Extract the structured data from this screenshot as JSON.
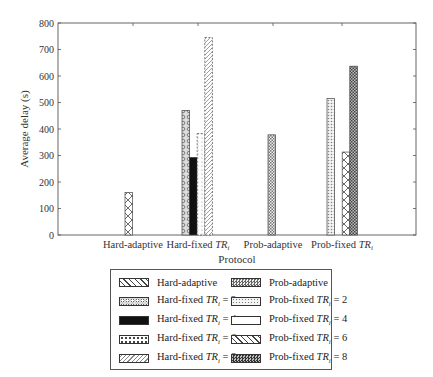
{
  "chart_data": {
    "type": "bar",
    "title": "",
    "xlabel": "Protocol",
    "ylabel": "Average delay (s)",
    "ylim": [
      0,
      800
    ],
    "yticks": [
      0,
      100,
      200,
      300,
      400,
      500,
      600,
      700,
      800
    ],
    "grid": false,
    "legend_position": "below plot, boxed, 2 columns",
    "categories": [
      "Hard-adaptive",
      "Hard-fixed TRi",
      "Prob-adaptive",
      "Prob-fixed TRi"
    ],
    "series": [
      {
        "name": "Hard-adaptive",
        "pattern": "xcross",
        "values": [
          160,
          0,
          0,
          0
        ]
      },
      {
        "name": "Hard-fixed TRi = 2",
        "pattern": "circles",
        "values": [
          0,
          470,
          0,
          0
        ]
      },
      {
        "name": "Hard-fixed TRi = 4",
        "pattern": "solid-black",
        "values": [
          0,
          293,
          0,
          0
        ]
      },
      {
        "name": "Hard-fixed TRi = 6",
        "pattern": "sparse-dots",
        "values": [
          0,
          383,
          0,
          0
        ]
      },
      {
        "name": "Hard-fixed TRi = 8",
        "pattern": "diagonal",
        "values": [
          0,
          745,
          0,
          0
        ]
      },
      {
        "name": "Prob-adaptive",
        "pattern": "dense-check",
        "values": [
          0,
          0,
          378,
          0
        ]
      },
      {
        "name": "Prob-fixed TRi = 2",
        "pattern": "dots",
        "values": [
          0,
          0,
          0,
          515
        ]
      },
      {
        "name": "Prob-fixed TRi = 4",
        "pattern": "white",
        "values": [
          0,
          0,
          0,
          0
        ]
      },
      {
        "name": "Prob-fixed TRi = 6",
        "pattern": "xcross",
        "values": [
          0,
          0,
          0,
          313
        ]
      },
      {
        "name": "Prob-fixed TRi = 8",
        "pattern": "dark-check",
        "values": [
          0,
          0,
          0,
          637
        ]
      }
    ]
  },
  "axis": {
    "ylabel": "Average delay (s)",
    "xlabel": "Protocol",
    "yticks": [
      "0",
      "100",
      "200",
      "300",
      "400",
      "500",
      "600",
      "700",
      "800"
    ],
    "xticks": [
      {
        "main": "Hard-adaptive",
        "italic": ""
      },
      {
        "main": "Hard-fixed ",
        "italic": "TR",
        "sub": "i"
      },
      {
        "main": "Prob-adaptive",
        "italic": ""
      },
      {
        "main": "Prob-fixed ",
        "italic": "TR",
        "sub": "i"
      }
    ]
  },
  "legend": {
    "items": [
      {
        "text": "Hard-adaptive",
        "pattern": "xcross"
      },
      {
        "text": "Prob-adaptive",
        "pattern": "dense-check"
      },
      {
        "text": "Hard-fixed TRi = 2",
        "pattern": "circles"
      },
      {
        "text": "Prob-fixed TRi = 2",
        "pattern": "dots"
      },
      {
        "text": "Hard-fixed TRi = 4",
        "pattern": "solid-black"
      },
      {
        "text": "Prob-fixed TRi = 4",
        "pattern": "white"
      },
      {
        "text": "Hard-fixed TRi = 6",
        "pattern": "sparse-dots"
      },
      {
        "text": "Prob-fixed TRi = 6",
        "pattern": "xcross"
      },
      {
        "text": "Hard-fixed TRi = 8",
        "pattern": "diagonal"
      },
      {
        "text": "Prob-fixed TRi = 8",
        "pattern": "dark-check"
      }
    ]
  }
}
